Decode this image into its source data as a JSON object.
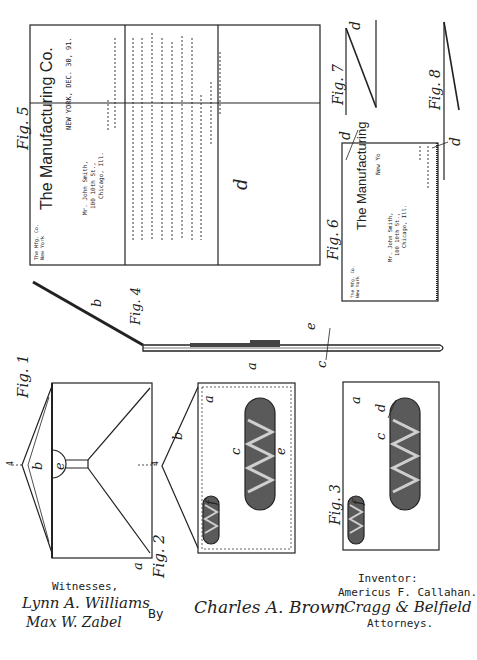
{
  "sheet": {
    "type": "patent-drawing",
    "orientation": "rotated-90",
    "colors": {
      "ink": "#222222",
      "paper": "#ffffff",
      "window_fill": "#555555"
    }
  },
  "figures": {
    "fig1": {
      "label": "Fig. 1",
      "parts": {
        "flap": "b",
        "seal": "e",
        "body": "a",
        "section_mark": "4"
      }
    },
    "fig2": {
      "label": "Fig. 2",
      "parts": {
        "body": "a",
        "flap": "b",
        "window_main_c": "c",
        "window_main_e": "e",
        "window_small": "f",
        "section_mark": "4"
      }
    },
    "fig3": {
      "label": "Fig. 3",
      "parts": {
        "body": "a",
        "window_c": "c",
        "window_d": "d",
        "window_e": "e",
        "window_small": "f"
      }
    },
    "fig4": {
      "label": "Fig. 4",
      "parts": {
        "flap": "b",
        "body": "a",
        "c": "c",
        "e": "e"
      }
    },
    "fig5": {
      "label": "Fig. 5",
      "part": "d",
      "letterhead": {
        "company": "The Manufacturing Co.",
        "dateline": "NEW YORK, DEC. 30, 91.",
        "return_address": [
          "The Mfg. Co.",
          "New York"
        ],
        "addressee": [
          "Mr. John Smith,",
          "100 10th St.,",
          "Chicago, Ill."
        ]
      }
    },
    "fig6": {
      "label": "Fig. 6",
      "part": "d",
      "letterhead": {
        "company": "The Manufacturing",
        "dateline": "New Yo",
        "return_address": [
          "The Mfg. Co.",
          "New York"
        ],
        "addressee": [
          "Mr. John Smith,",
          "100 10th St.,",
          "Chicago, Ill."
        ]
      }
    },
    "fig7": {
      "label": "Fig. 7",
      "part": "d"
    },
    "fig8": {
      "label": "Fig. 8",
      "part": "d"
    }
  },
  "footer": {
    "witnesses_label": "Witnesses,",
    "witness_signatures": [
      "Lynn A. Williams",
      "Max W. Zabel"
    ],
    "by_label": "By",
    "inventor_label": "Inventor:",
    "inventor_name": "Americus F. Callahan.",
    "inventor_signature": "Charles A. Brown",
    "attorney_signature": "Cragg & Belfield",
    "attorneys_label": "Attorneys."
  }
}
